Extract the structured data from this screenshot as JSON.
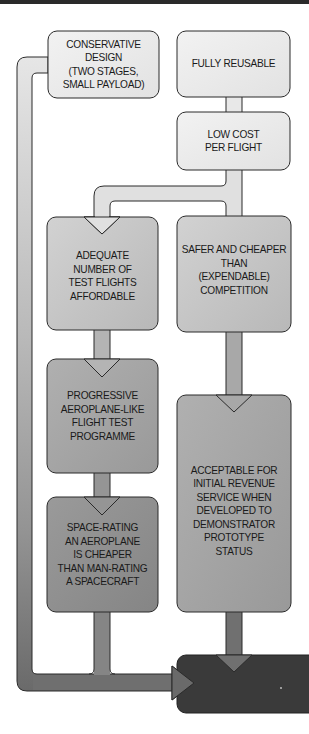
{
  "diagram": {
    "type": "flowchart",
    "colors": {
      "level1": "#ececec",
      "level2": "#c6c6c6",
      "level3": "#a6a6a6",
      "level4": "#8e8e8e",
      "final": "#3a3a3a",
      "outline": "#2b2b2b",
      "text": "#1a1a1a",
      "topbar": "#2a2a2a"
    },
    "nodes": [
      {
        "id": "conservative-design",
        "label": "CONSERVATIVE\nDESIGN\n(TWO STAGES,\nSMALL PAYLOAD)"
      },
      {
        "id": "fully-reusable",
        "label": "FULLY REUSABLE"
      },
      {
        "id": "low-cost-per-flight",
        "label": "LOW COST\nPER FLIGHT"
      },
      {
        "id": "adequate-test-flights",
        "label": "ADEQUATE\nNUMBER OF\nTEST FLIGHTS\nAFFORDABLE"
      },
      {
        "id": "safer-and-cheaper",
        "label": "SAFER AND CHEAPER\nTHAN\n(EXPENDABLE)\nCOMPETITION"
      },
      {
        "id": "progressive-flight-test",
        "label": "PROGRESSIVE\nAEROPLANE-LIKE\nFLIGHT TEST\nPROGRAMME"
      },
      {
        "id": "acceptable-for-revenue",
        "label": "ACCEPTABLE FOR\nINITIAL REVENUE\nSERVICE WHEN\nDEVELOPED TO\nDEMONSTRATOR\nPROTOTYPE\nSTATUS"
      },
      {
        "id": "space-rating-cheaper",
        "label": "SPACE-RATING\nAN AEROPLANE\nIS CHEAPER\nTHAN MAN-RATING\nA SPACECRAFT"
      },
      {
        "id": "final-outcome",
        "label": ""
      }
    ],
    "edges": [
      {
        "from": "fully-reusable",
        "to": "low-cost-per-flight"
      },
      {
        "from": "low-cost-per-flight",
        "to": "adequate-test-flights"
      },
      {
        "from": "low-cost-per-flight",
        "to": "safer-and-cheaper"
      },
      {
        "from": "adequate-test-flights",
        "to": "progressive-flight-test"
      },
      {
        "from": "progressive-flight-test",
        "to": "space-rating-cheaper"
      },
      {
        "from": "safer-and-cheaper",
        "to": "acceptable-for-revenue"
      },
      {
        "from": "acceptable-for-revenue",
        "to": "final-outcome"
      },
      {
        "from": "space-rating-cheaper",
        "to": "final-outcome"
      },
      {
        "from": "conservative-design",
        "to": "final-outcome"
      }
    ]
  }
}
